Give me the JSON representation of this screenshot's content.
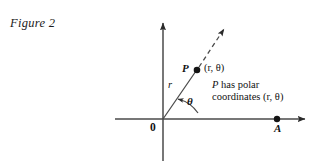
{
  "figure": {
    "caption": "Figure 2",
    "background_color": "#ffffff",
    "ink_color": "#2b2b2b",
    "width": 328,
    "height": 164
  },
  "axes": {
    "x_axis_name": "horizontal-axis",
    "y_axis_name": "vertical-axis",
    "origin_label": "0",
    "origin_x": 163,
    "origin_y": 119,
    "x_axis_start_x": 115,
    "x_axis_end_x": 313,
    "y_axis_top_y": 15,
    "y_axis_bottom_y": 161
  },
  "points": {
    "origin": {
      "label": "0",
      "x": 163,
      "y": 119
    },
    "p": {
      "label": "P",
      "coords_text": "(r, θ)",
      "x": 197,
      "y": 70
    },
    "a": {
      "label": "A",
      "x": 277,
      "y": 119
    }
  },
  "segments": {
    "radius": {
      "label": "r",
      "from": "origin",
      "to": "p"
    },
    "ray": {
      "style": "dashed",
      "arrow_tip_x": 228,
      "arrow_tip_y": 22
    }
  },
  "angle": {
    "label": "θ",
    "arc_from_axis": "positive-x-axis",
    "arc_to_segment": "radius",
    "arrow_end": "radius"
  },
  "annotation": {
    "line1": "P has polar",
    "line2_prefix": "coordinates ",
    "line2_coords": "(r, θ)"
  }
}
